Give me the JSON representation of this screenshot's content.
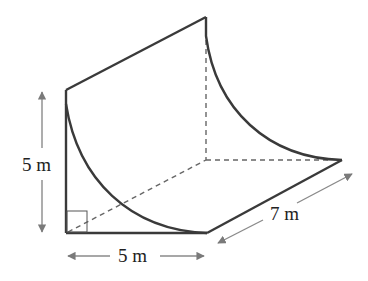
{
  "diagram": {
    "type": "3D prism with quarter-circle cross-section removed",
    "labels": {
      "height": "5 m",
      "width": "5 m",
      "length": "7 m"
    },
    "colors": {
      "edge": "#3a3a3a",
      "hidden_edge": "#666666",
      "dimension_arrow": "#7a7a7a",
      "text": "#222222"
    },
    "markers": {
      "right_angle": "right-angle-marker"
    }
  }
}
